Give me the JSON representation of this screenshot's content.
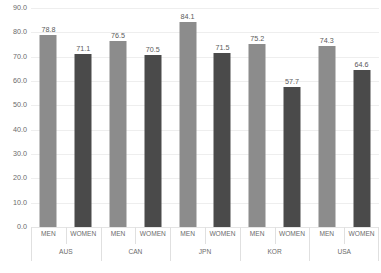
{
  "chart_data": {
    "type": "bar",
    "title": "",
    "subtitle": "",
    "xlabel": "",
    "ylabel": "",
    "ylim": [
      0.0,
      90.0
    ],
    "ytick_step": 10.0,
    "ytick_labels": [
      "90.0",
      "80.0",
      "70.0",
      "60.0",
      "50.0",
      "40.0",
      "30.0",
      "20.0",
      "10.0",
      "0.0"
    ],
    "ytick_values": [
      90.0,
      80.0,
      70.0,
      60.0,
      50.0,
      40.0,
      30.0,
      20.0,
      10.0,
      0.0
    ],
    "grid": true,
    "legend": "none",
    "categories": [
      "AUS",
      "CAN",
      "JPN",
      "KOR",
      "USA"
    ],
    "series": [
      {
        "name": "MEN",
        "color": "#8c8c8c",
        "values": [
          78.8,
          76.5,
          84.1,
          75.2,
          74.3
        ]
      },
      {
        "name": "WOMEN",
        "color": "#4a4a4a",
        "values": [
          71.1,
          70.5,
          71.5,
          57.7,
          64.6
        ]
      }
    ],
    "bars": [
      {
        "group": "AUS",
        "series": "MEN",
        "value": 78.8,
        "label": "78.8",
        "color": "#8c8c8c"
      },
      {
        "group": "AUS",
        "series": "WOMEN",
        "value": 71.1,
        "label": "71.1",
        "color": "#4a4a4a"
      },
      {
        "group": "CAN",
        "series": "MEN",
        "value": 76.5,
        "label": "76.5",
        "color": "#8c8c8c"
      },
      {
        "group": "CAN",
        "series": "WOMEN",
        "value": 70.5,
        "label": "70.5",
        "color": "#4a4a4a"
      },
      {
        "group": "JPN",
        "series": "MEN",
        "value": 84.1,
        "label": "84.1",
        "color": "#8c8c8c"
      },
      {
        "group": "JPN",
        "series": "WOMEN",
        "value": 71.5,
        "label": "71.5",
        "color": "#4a4a4a"
      },
      {
        "group": "KOR",
        "series": "MEN",
        "value": 75.2,
        "label": "75.2",
        "color": "#8c8c8c"
      },
      {
        "group": "KOR",
        "series": "WOMEN",
        "value": 57.7,
        "label": "57.7",
        "color": "#4a4a4a"
      },
      {
        "group": "USA",
        "series": "MEN",
        "value": 74.3,
        "label": "74.3",
        "color": "#8c8c8c"
      },
      {
        "group": "USA",
        "series": "WOMEN",
        "value": 64.6,
        "label": "64.6",
        "color": "#4a4a4a"
      }
    ]
  }
}
